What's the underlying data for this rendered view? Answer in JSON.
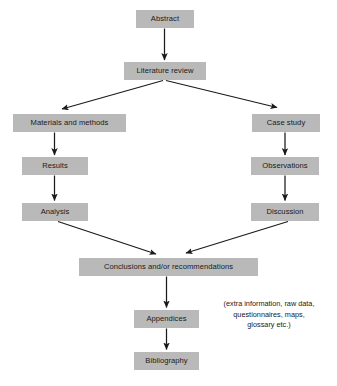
{
  "diagram": {
    "background_color": "#ffffff",
    "node_fill_color": "#b9b9b9",
    "node_text_color": "#1a1a1a",
    "arrow_color": "#1a1a1a",
    "nodes": [
      {
        "id": "abstract",
        "label": "Abstract"
      },
      {
        "id": "literature",
        "label": "Literature review"
      },
      {
        "id": "materials",
        "label": "Materials and methods"
      },
      {
        "id": "case_study",
        "label": "Case study"
      },
      {
        "id": "results",
        "label": "Results"
      },
      {
        "id": "observations",
        "label": "Observations"
      },
      {
        "id": "analysis",
        "label": "Analysis"
      },
      {
        "id": "discussion",
        "label": "Discussion"
      },
      {
        "id": "conclusions",
        "label": "Conclusions and/or recommendations"
      },
      {
        "id": "appendices",
        "label": "Appendices"
      },
      {
        "id": "bibliography",
        "label": "Bibliography"
      }
    ],
    "annotation": {
      "id": "appendices_note",
      "text": "(extra information, raw data,\nquestionnaires, maps,\nglossary etc.)"
    },
    "edges": [
      {
        "from": "abstract",
        "to": "literature",
        "style": "straight-down"
      },
      {
        "from": "literature",
        "to": "materials",
        "style": "diagonal-left"
      },
      {
        "from": "literature",
        "to": "case_study",
        "style": "diagonal-right"
      },
      {
        "from": "materials",
        "to": "results",
        "style": "straight-down"
      },
      {
        "from": "results",
        "to": "analysis",
        "style": "straight-down"
      },
      {
        "from": "case_study",
        "to": "observations",
        "style": "straight-down"
      },
      {
        "from": "observations",
        "to": "discussion",
        "style": "straight-down"
      },
      {
        "from": "analysis",
        "to": "conclusions",
        "style": "diagonal-right-down"
      },
      {
        "from": "discussion",
        "to": "conclusions",
        "style": "diagonal-left-down"
      },
      {
        "from": "conclusions",
        "to": "appendices",
        "style": "straight-down"
      },
      {
        "from": "appendices",
        "to": "bibliography",
        "style": "straight-down"
      }
    ]
  }
}
